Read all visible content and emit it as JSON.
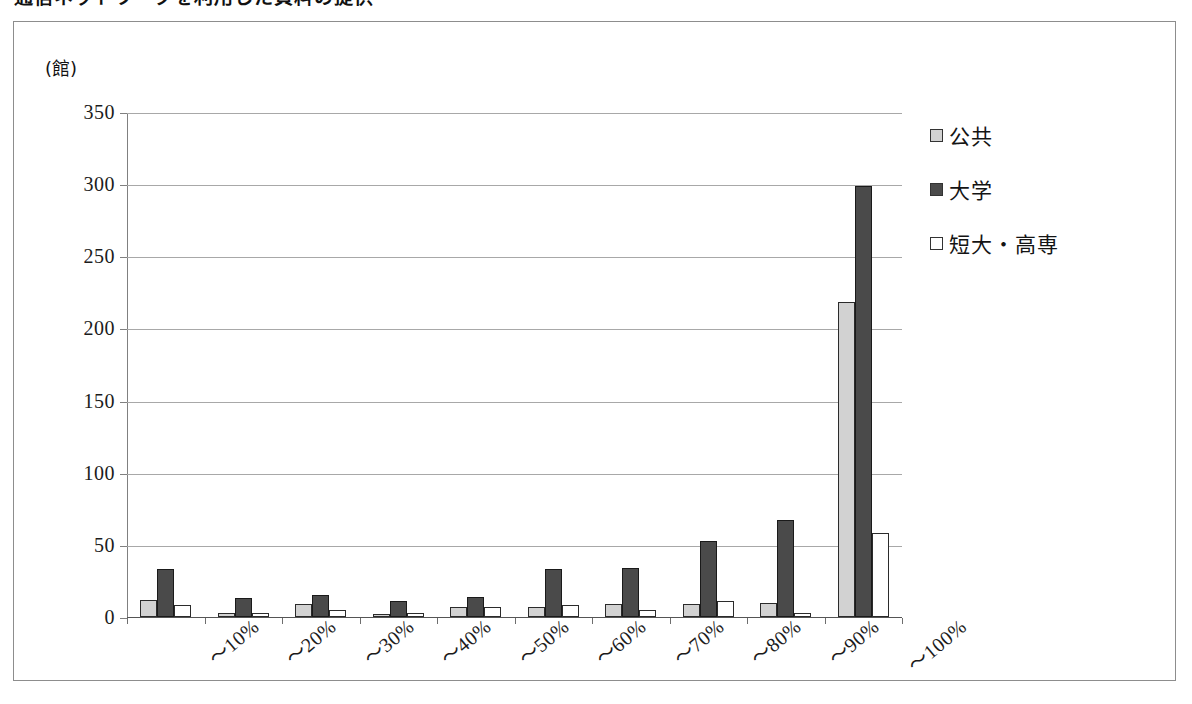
{
  "page": {
    "title_partial": "通信ネットワークを利用した資料の提供",
    "unit_label": "(館)"
  },
  "chart_data": {
    "type": "bar",
    "title": "",
    "xlabel": "",
    "ylabel": "(館)",
    "categories": [
      "～10%",
      "～20%",
      "～30%",
      "～40%",
      "～50%",
      "～60%",
      "～70%",
      "～80%",
      "～90%",
      "～100%"
    ],
    "series": [
      {
        "name": "公共",
        "color": "#d2d2d2",
        "values": [
          12,
          3,
          9,
          2,
          7,
          7,
          9,
          9,
          10,
          218
        ]
      },
      {
        "name": "大学",
        "color": "#4a4a4a",
        "values": [
          33,
          13,
          15,
          11,
          14,
          33,
          34,
          53,
          67,
          299
        ]
      },
      {
        "name": "短大・高専",
        "color": "#ffffff",
        "values": [
          8,
          3,
          5,
          3,
          7,
          8,
          5,
          11,
          3,
          58
        ]
      }
    ],
    "ylim": [
      0,
      350
    ],
    "yticks": [
      0,
      50,
      100,
      150,
      200,
      250,
      300,
      350
    ],
    "ytick_labels": [
      "0",
      "50",
      "100",
      "150",
      "200",
      "250",
      "300",
      "350"
    ],
    "grid": true,
    "legend_position": "right"
  },
  "legend": {
    "entries": [
      {
        "label": "公共"
      },
      {
        "label": "大学"
      },
      {
        "label": "短大・高専"
      }
    ]
  }
}
